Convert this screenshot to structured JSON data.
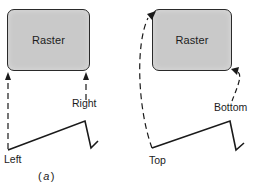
{
  "figure": {
    "caption": "(a)",
    "caption_letter": "a",
    "panels": [
      {
        "id": "left",
        "raster_label": "Raster",
        "scan_start_label": "Left",
        "scan_end_label": "Right",
        "arrow_style": "straight-dashed"
      },
      {
        "id": "right",
        "raster_label": "Raster",
        "scan_start_label": "Top",
        "scan_end_label": "Bottom",
        "arrow_style": "curved-dashed"
      }
    ]
  },
  "colors": {
    "raster_fill": "#c9c9c9",
    "line": "#1a1a1a",
    "background": "#ffffff"
  }
}
